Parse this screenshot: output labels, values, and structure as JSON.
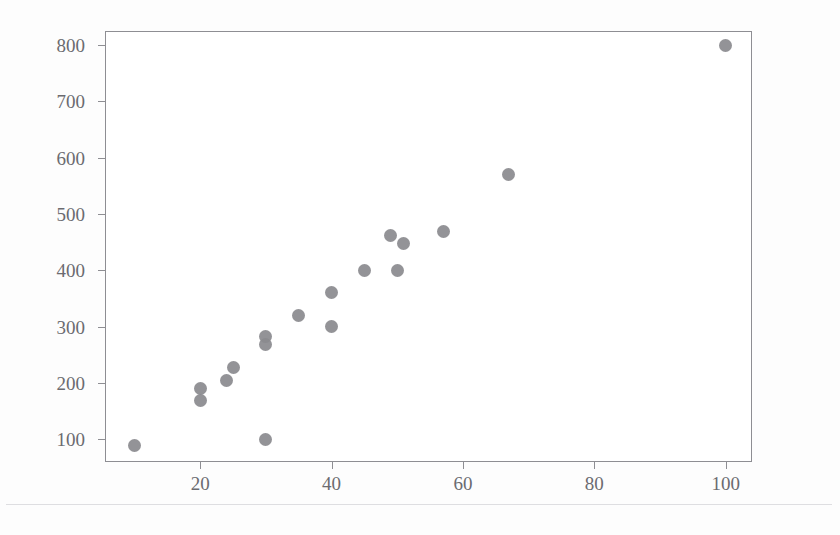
{
  "figure": {
    "background_color": "#ffffff",
    "axes_color": "#8e8e93",
    "marker_color": "#8a8a8e",
    "tick_label_color": "#6b6b70"
  },
  "chart_data": {
    "type": "scatter",
    "title": "",
    "xlabel": "",
    "ylabel": "",
    "xlim": [
      5.5,
      104
    ],
    "ylim": [
      60,
      825
    ],
    "grid": false,
    "legend": null,
    "xticks": [
      20,
      40,
      60,
      80,
      100
    ],
    "yticks": [
      100,
      200,
      300,
      400,
      500,
      600,
      700,
      800
    ],
    "xtick_labels": [
      "20",
      "40",
      "60",
      "80",
      "100"
    ],
    "ytick_labels": [
      "100",
      "200",
      "300",
      "400",
      "500",
      "600",
      "700",
      "800"
    ],
    "marker": "circle",
    "points": [
      {
        "x": 10,
        "y": 90
      },
      {
        "x": 20,
        "y": 170
      },
      {
        "x": 20,
        "y": 190
      },
      {
        "x": 24,
        "y": 205
      },
      {
        "x": 25,
        "y": 228
      },
      {
        "x": 30,
        "y": 100
      },
      {
        "x": 30,
        "y": 268
      },
      {
        "x": 30,
        "y": 282
      },
      {
        "x": 35,
        "y": 320
      },
      {
        "x": 40,
        "y": 300
      },
      {
        "x": 40,
        "y": 360
      },
      {
        "x": 45,
        "y": 400
      },
      {
        "x": 49,
        "y": 462
      },
      {
        "x": 51,
        "y": 448
      },
      {
        "x": 50,
        "y": 400
      },
      {
        "x": 57,
        "y": 470
      },
      {
        "x": 67,
        "y": 570
      },
      {
        "x": 100,
        "y": 800
      }
    ]
  }
}
